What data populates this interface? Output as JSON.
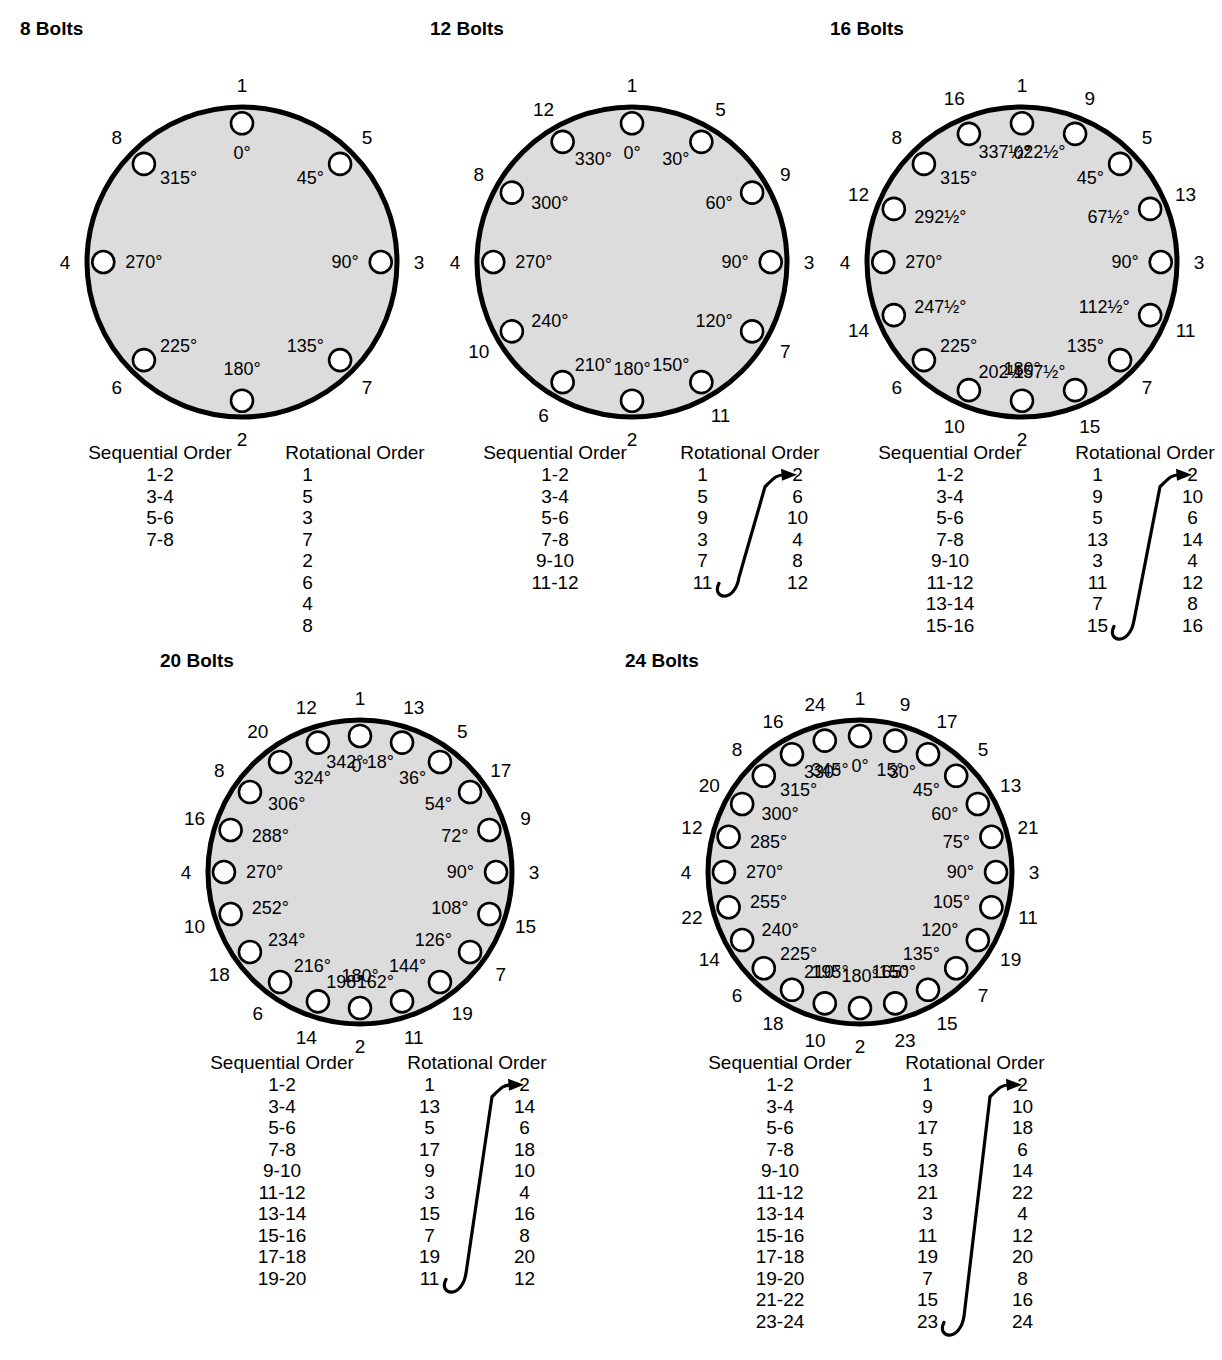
{
  "colors": {
    "disc_fill": "#dcdcdc",
    "disc_stroke": "#000000",
    "hole_fill": "#ffffff",
    "text": "#000000"
  },
  "table_headers": {
    "sequential": "Sequential Order",
    "rotational": "Rotational Order"
  },
  "panels": [
    {
      "id": "bolts-8",
      "title": "8 Bolts",
      "count": 8,
      "angle_labels": [
        "0°",
        "45°",
        "90°",
        "135°",
        "180°",
        "225°",
        "270°",
        "315°"
      ],
      "angles_deg": [
        0,
        45,
        90,
        135,
        180,
        225,
        270,
        315
      ],
      "seq_numbers": [
        "1",
        "5",
        "3",
        "7",
        "2",
        "6",
        "4",
        "8"
      ],
      "table": {
        "sequential": [
          "1-2",
          "3-4",
          "5-6",
          "7-8"
        ],
        "rotational_single": [
          "1",
          "5",
          "3",
          "7",
          "2",
          "6",
          "4",
          "8"
        ],
        "rotational_left": [],
        "rotational_right": [],
        "has_arrow": false,
        "two_column": false
      }
    },
    {
      "id": "bolts-12",
      "title": "12 Bolts",
      "count": 12,
      "angle_labels": [
        "0°",
        "30°",
        "60°",
        "90°",
        "120°",
        "150°",
        "180°",
        "210°",
        "240°",
        "270°",
        "300°",
        "330°"
      ],
      "angles_deg": [
        0,
        30,
        60,
        90,
        120,
        150,
        180,
        210,
        240,
        270,
        300,
        330
      ],
      "seq_numbers": [
        "1",
        "5",
        "9",
        "3",
        "7",
        "11",
        "2",
        "6",
        "10",
        "4",
        "8",
        "12"
      ],
      "table": {
        "sequential": [
          "1-2",
          "3-4",
          "5-6",
          "7-8",
          "9-10",
          "11-12"
        ],
        "rotational_single": [],
        "rotational_left": [
          "1",
          "5",
          "9",
          "3",
          "7",
          "11"
        ],
        "rotational_right": [
          "2",
          "6",
          "10",
          "4",
          "8",
          "12"
        ],
        "has_arrow": true,
        "two_column": true
      }
    },
    {
      "id": "bolts-16",
      "title": "16 Bolts",
      "count": 16,
      "angle_labels": [
        "0°",
        "22½°",
        "45°",
        "67½°",
        "90°",
        "112½°",
        "135°",
        "157½°",
        "180°",
        "202½°",
        "225°",
        "247½°",
        "270°",
        "292½°",
        "315°",
        "337½°"
      ],
      "angles_deg": [
        0,
        22.5,
        45,
        67.5,
        90,
        112.5,
        135,
        157.5,
        180,
        202.5,
        225,
        247.5,
        270,
        292.5,
        315,
        337.5
      ],
      "seq_numbers": [
        "1",
        "9",
        "5",
        "13",
        "3",
        "11",
        "7",
        "15",
        "2",
        "10",
        "6",
        "14",
        "4",
        "12",
        "8",
        "16"
      ],
      "table": {
        "sequential": [
          "1-2",
          "3-4",
          "5-6",
          "7-8",
          "9-10",
          "11-12",
          "13-14",
          "15-16"
        ],
        "rotational_single": [],
        "rotational_left": [
          "1",
          "9",
          "5",
          "13",
          "3",
          "11",
          "7",
          "15"
        ],
        "rotational_right": [
          "2",
          "10",
          "6",
          "14",
          "4",
          "12",
          "8",
          "16"
        ],
        "has_arrow": true,
        "two_column": true
      }
    },
    {
      "id": "bolts-20",
      "title": "20 Bolts",
      "count": 20,
      "angle_labels": [
        "0°",
        "18°",
        "36°",
        "54°",
        "72°",
        "90°",
        "108°",
        "126°",
        "144°",
        "162°",
        "180°",
        "198°",
        "216°",
        "234°",
        "252°",
        "270°",
        "288°",
        "306°",
        "324°",
        "342°"
      ],
      "angles_deg": [
        0,
        18,
        36,
        54,
        72,
        90,
        108,
        126,
        144,
        162,
        180,
        198,
        216,
        234,
        252,
        270,
        288,
        306,
        324,
        342
      ],
      "seq_numbers": [
        "1",
        "13",
        "5",
        "17",
        "9",
        "3",
        "15",
        "7",
        "19",
        "11",
        "2",
        "14",
        "6",
        "18",
        "10",
        "4",
        "16",
        "8",
        "20",
        "12"
      ],
      "table": {
        "sequential": [
          "1-2",
          "3-4",
          "5-6",
          "7-8",
          "9-10",
          "11-12",
          "13-14",
          "15-16",
          "17-18",
          "19-20"
        ],
        "rotational_single": [],
        "rotational_left": [
          "1",
          "13",
          "5",
          "17",
          "9",
          "3",
          "15",
          "7",
          "19",
          "11"
        ],
        "rotational_right": [
          "2",
          "14",
          "6",
          "18",
          "10",
          "4",
          "16",
          "8",
          "20",
          "12"
        ],
        "has_arrow": true,
        "two_column": true
      }
    },
    {
      "id": "bolts-24",
      "title": "24 Bolts",
      "count": 24,
      "angle_labels": [
        "0°",
        "15°",
        "30°",
        "45°",
        "60°",
        "75°",
        "90°",
        "105°",
        "120°",
        "135°",
        "150°",
        "165°",
        "180°",
        "195°",
        "210°",
        "225°",
        "240°",
        "255°",
        "270°",
        "285°",
        "300°",
        "315°",
        "330°",
        "345°"
      ],
      "angles_deg": [
        0,
        15,
        30,
        45,
        60,
        75,
        90,
        105,
        120,
        135,
        150,
        165,
        180,
        195,
        210,
        225,
        240,
        255,
        270,
        285,
        300,
        315,
        330,
        345
      ],
      "seq_numbers": [
        "1",
        "9",
        "17",
        "5",
        "13",
        "21",
        "3",
        "11",
        "19",
        "7",
        "15",
        "23",
        "2",
        "10",
        "18",
        "6",
        "14",
        "22",
        "4",
        "12",
        "20",
        "8",
        "16",
        "24"
      ],
      "table": {
        "sequential": [
          "1-2",
          "3-4",
          "5-6",
          "7-8",
          "9-10",
          "11-12",
          "13-14",
          "15-16",
          "17-18",
          "19-20",
          "21-22",
          "23-24"
        ],
        "rotational_single": [],
        "rotational_left": [
          "1",
          "9",
          "17",
          "5",
          "13",
          "21",
          "3",
          "11",
          "19",
          "7",
          "15",
          "23"
        ],
        "rotational_right": [
          "2",
          "10",
          "18",
          "6",
          "14",
          "22",
          "4",
          "12",
          "20",
          "8",
          "16",
          "24"
        ],
        "has_arrow": true,
        "two_column": true
      }
    }
  ]
}
